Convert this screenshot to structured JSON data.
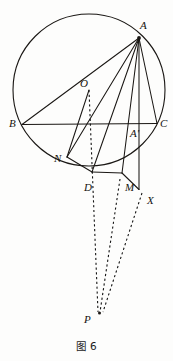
{
  "figure": {
    "caption": "图 6",
    "caption_x": 0,
    "caption_y": 338,
    "width": 173,
    "height": 361,
    "stroke_color": "#1a1714",
    "dash_color": "#141414",
    "background": "#fdfdfc"
  },
  "circle": {
    "name": "circumcircle",
    "cx": 89,
    "cy": 90,
    "r": 76,
    "stroke_width": 1.1
  },
  "points": [
    {
      "id": "A",
      "label": "A",
      "x": 139.0,
      "y": 38.0,
      "label_x": 140,
      "label_y": 20,
      "on_circle": true
    },
    {
      "id": "B",
      "label": "B",
      "x": 22.0,
      "y": 124.5,
      "label_x": 9,
      "label_y": 118,
      "on_circle": true
    },
    {
      "id": "C",
      "label": "C",
      "x": 157.0,
      "y": 123.5,
      "label_x": 160,
      "label_y": 118,
      "on_circle": true
    },
    {
      "id": "O",
      "label": "O",
      "x": 89.0,
      "y": 90.0,
      "label_x": 80,
      "label_y": 78,
      "on_circle": false
    },
    {
      "id": "Ap",
      "label": "A'",
      "x": 139.0,
      "y": 123.8,
      "label_x": 130,
      "label_y": 128,
      "on_circle": false
    },
    {
      "id": "N",
      "label": "N",
      "x": 67.0,
      "y": 157.0,
      "label_x": 54,
      "label_y": 153,
      "on_circle": true
    },
    {
      "id": "D",
      "label": "D",
      "x": 92.0,
      "y": 172.0,
      "label_x": 84,
      "label_y": 182,
      "on_circle": true
    },
    {
      "id": "M",
      "label": "M",
      "x": 122.0,
      "y": 173.0,
      "label_x": 125,
      "label_y": 182,
      "on_circle": false
    },
    {
      "id": "X",
      "label": "X",
      "x": 139.0,
      "y": 189.5,
      "label_x": 147,
      "label_y": 195,
      "on_circle": false
    },
    {
      "id": "P",
      "label": "P",
      "x": 98.0,
      "y": 314.0,
      "label_x": 84,
      "label_y": 314,
      "on_circle": false
    }
  ],
  "solid_segments": [
    {
      "name": "chord-BC",
      "from": "B",
      "to": "C"
    },
    {
      "name": "chord-AB",
      "from": "A",
      "to": "B"
    },
    {
      "name": "chord-AC",
      "from": "A",
      "to": "C"
    },
    {
      "name": "cevian-AN",
      "from": "A",
      "to": "N"
    },
    {
      "name": "cevian-AD",
      "from": "A",
      "to": "D"
    },
    {
      "name": "cevian-AM",
      "from": "A",
      "to": "M"
    },
    {
      "name": "altitude-AX",
      "from": "A",
      "to": "X"
    },
    {
      "name": "transversal-ND",
      "from": "N",
      "to": "D"
    },
    {
      "name": "transversal-DM",
      "from": "D",
      "to": "M"
    },
    {
      "name": "transversal-MX",
      "from": "M",
      "to": "X"
    },
    {
      "name": "radius-ON",
      "from": "O",
      "to": "N"
    }
  ],
  "dashed_segments": [
    {
      "name": "dashed-OD-extended-to-P",
      "from_x": 89,
      "from_y": 90,
      "to_x": 98,
      "to_y": 312
    },
    {
      "name": "dashed-M-to-P",
      "from_x": 120,
      "from_y": 179,
      "to_x": 100,
      "to_y": 312
    },
    {
      "name": "dashed-X-to-P",
      "from_x": 142,
      "from_y": 193,
      "to_x": 103,
      "to_y": 312
    }
  ],
  "dot_markers": [
    {
      "name": "vertex-dot-A",
      "x": 139.0,
      "y": 38.0,
      "r": 1.9
    },
    {
      "name": "vertex-dot-P",
      "x": 99.5,
      "y": 313.0,
      "r": 1.5
    }
  ]
}
